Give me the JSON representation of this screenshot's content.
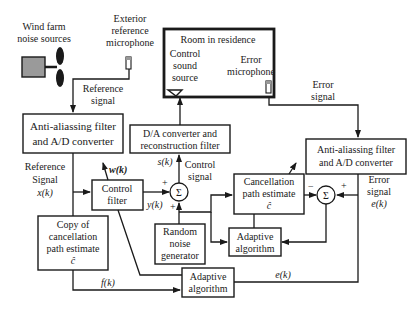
{
  "diagram": {
    "title": "",
    "labels": {
      "wind_farm": [
        "Wind farm",
        "noise sources"
      ],
      "exterior_mic": [
        "Exterior",
        "reference",
        "microphone"
      ],
      "reference_signal": [
        "Reference",
        "signal"
      ],
      "room": "Room in residence",
      "control_sound_source": [
        "Control",
        "sound",
        "source"
      ],
      "error_microphone": [
        "Error",
        "microphone"
      ],
      "error_signal_top": [
        "Error",
        "signal"
      ],
      "aa_left": [
        "Anti-aliassing filter",
        "and A/D converter"
      ],
      "aa_right": [
        "Anti-aliassing filter",
        "and A/D converter"
      ],
      "da": [
        "D/A converter and",
        "reconstruction filter"
      ],
      "ref_signal_xk": [
        "Reference",
        "Signal",
        "x(k)"
      ],
      "control_filter": [
        "Control",
        "filter"
      ],
      "wk": "w(k)",
      "yk": "y(k)",
      "sk": "s(k)",
      "control_signal": [
        "Control",
        "signal"
      ],
      "cancel_path": [
        "Cancellation",
        "path estimate",
        "ĉ"
      ],
      "copy_cancel": [
        "Copy of",
        "cancellation",
        "path estimate",
        "ĉ"
      ],
      "random_noise": [
        "Random",
        "noise",
        "generator"
      ],
      "adaptive_right": [
        "Adaptive",
        "algorithm"
      ],
      "adaptive_bottom": [
        "Adaptive",
        "algorithm"
      ],
      "error_signal_ek": [
        "Error",
        "signal",
        "e(k)"
      ],
      "ek_bottom": "e(k)",
      "fk": "f(k)",
      "sigma": "Σ",
      "plus": "+",
      "minus": "−"
    }
  }
}
